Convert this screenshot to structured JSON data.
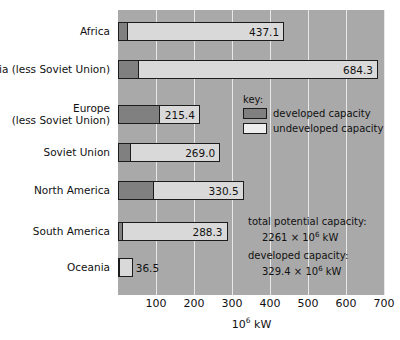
{
  "chart_data": {
    "type": "bar",
    "orientation": "horizontal",
    "stacked": true,
    "title": "",
    "xlabel": "10⁶ kW",
    "ylabel": "",
    "xlim": [
      0,
      700
    ],
    "xticks": [
      "100",
      "200",
      "300",
      "400",
      "500",
      "600",
      "700"
    ],
    "xtick_values": [
      100,
      200,
      300,
      400,
      500,
      600,
      700
    ],
    "grid": true,
    "grid_axis": "x",
    "legend_position": "inside-upper-right",
    "categories": [
      "Africa",
      "Asia (less Soviet Union)",
      "Europe\n(less Soviet Union)",
      "Soviet Union",
      "North America",
      "South America",
      "Oceania"
    ],
    "category_lines": [
      [
        "Africa"
      ],
      [
        "Asia (less Soviet Union)"
      ],
      [
        "Europe",
        "(less Soviet Union)"
      ],
      [
        "Soviet Union"
      ],
      [
        "North America"
      ],
      [
        "South America"
      ],
      [
        "Oceania"
      ]
    ],
    "series": [
      {
        "name": "developed capacity",
        "color": "#808080",
        "values": [
          26,
          55,
          110,
          33,
          95,
          13,
          3
        ]
      },
      {
        "name": "undeveloped capacity",
        "color": "#d9d9d9",
        "values": [
          411.1,
          629.3,
          105.4,
          236.0,
          235.5,
          275.3,
          33.5
        ]
      }
    ],
    "totals": [
      437.1,
      684.3,
      215.4,
      269.0,
      330.5,
      288.3,
      36.5
    ],
    "value_labels": [
      "437.1",
      "684.3",
      "215.4",
      "269.0",
      "330.5",
      "288.3",
      "36.5"
    ],
    "value_label_placement": [
      "inside",
      "inside",
      "inside",
      "inside",
      "inside",
      "inside",
      "outside"
    ]
  },
  "legend": {
    "title": "key:",
    "entries": [
      {
        "label": "developed capacity",
        "swatch": "dev-swatch",
        "color": "#808080"
      },
      {
        "label": "undeveloped capacity",
        "swatch": "undev-swatch",
        "color": "#eeeeee"
      }
    ]
  },
  "annotations": [
    {
      "heading": "total potential capacity:",
      "value_number": "2261",
      "value_times": "×",
      "value_base": "10",
      "value_exp": "6",
      "value_unit": "kW"
    },
    {
      "heading": "developed capacity:",
      "value_number": "329.4",
      "value_times": "×",
      "value_base": "10",
      "value_exp": "6",
      "value_unit": "kW"
    }
  ],
  "axis": {
    "x_title_base": "10",
    "x_title_exp": "6",
    "x_title_unit": "kW"
  },
  "colors": {
    "plot_background": "#a9a9a9",
    "gridline": "#e8e8e8",
    "developed": "#808080",
    "undeveloped": "#d9d9d9",
    "outline": "#1c1c1c",
    "text": "#111111",
    "page_background": "#ffffff"
  }
}
